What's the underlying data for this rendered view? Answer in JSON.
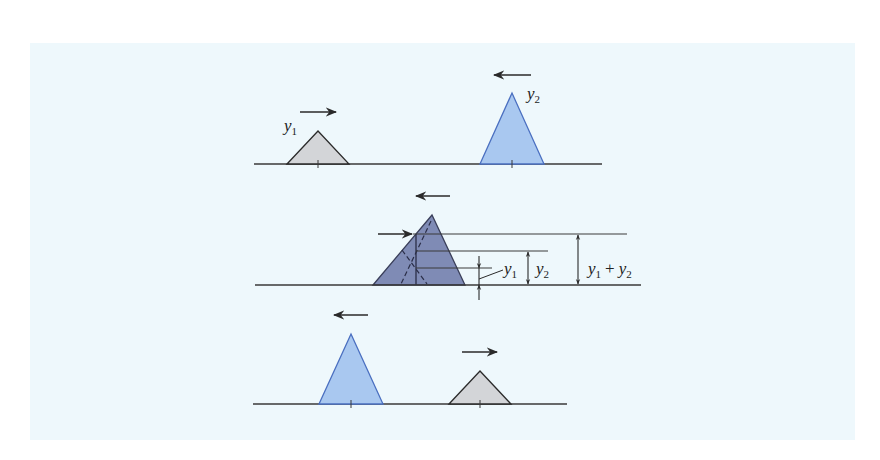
{
  "figure": {
    "background_color": "#eef8fc",
    "colors": {
      "pulse_y1_fill": "#d3d5d8",
      "pulse_y1_stroke": "#2a2a2a",
      "pulse_y2_fill": "#a9c8f0",
      "pulse_y2_stroke": "#4a6fc0",
      "superposition_fill": "#7f8bb5",
      "superposition_stroke": "#3a3f5a",
      "line": "#3a3a3a"
    },
    "panels": [
      {
        "name": "before-overlap",
        "pulses": [
          {
            "id": "y1",
            "label": "y",
            "subscript": "1",
            "direction": "right",
            "shape": "short-wide"
          },
          {
            "id": "y2",
            "label": "y",
            "subscript": "2",
            "direction": "left",
            "shape": "tall-narrow"
          }
        ]
      },
      {
        "name": "overlap-superposition",
        "direction_arrows": [
          "right",
          "left"
        ],
        "dimensions": [
          {
            "id": "y1",
            "label": "y",
            "subscript": "1"
          },
          {
            "id": "y2",
            "label": "y",
            "subscript": "2"
          },
          {
            "id": "sum",
            "label_a": "y",
            "sub_a": "1",
            "plus": "+",
            "label_b": "y",
            "sub_b": "2"
          }
        ]
      },
      {
        "name": "after-overlap",
        "pulses": [
          {
            "id": "y2",
            "direction": "left",
            "shape": "tall-narrow"
          },
          {
            "id": "y1",
            "direction": "right",
            "shape": "short-wide"
          }
        ]
      }
    ]
  }
}
